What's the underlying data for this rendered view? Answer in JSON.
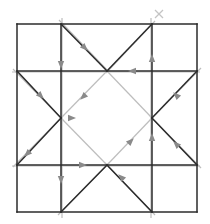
{
  "diagram": {
    "type": "crease-pattern-flow",
    "colors": {
      "background": "#ffffff",
      "dark_line": "#2b2b2b",
      "light_line": "#bdbdbd",
      "arrow": "#8a8a8a",
      "marker": "#c4c4c4"
    },
    "grid": {
      "outer": {
        "x1": 17,
        "y1": 24,
        "x2": 197,
        "y2": 212
      },
      "verticals": [
        61,
        152
      ],
      "horizontals": [
        71,
        165
      ]
    },
    "dark_lines": [
      {
        "x1": 17,
        "y1": 24,
        "x2": 197,
        "y2": 24
      },
      {
        "x1": 17,
        "y1": 212,
        "x2": 197,
        "y2": 212
      },
      {
        "x1": 17,
        "y1": 24,
        "x2": 17,
        "y2": 212
      },
      {
        "x1": 197,
        "y1": 24,
        "x2": 197,
        "y2": 212
      },
      {
        "x1": 61,
        "y1": 24,
        "x2": 61,
        "y2": 212
      },
      {
        "x1": 152,
        "y1": 24,
        "x2": 152,
        "y2": 212
      },
      {
        "x1": 17,
        "y1": 71,
        "x2": 197,
        "y2": 71
      },
      {
        "x1": 17,
        "y1": 165,
        "x2": 197,
        "y2": 165
      },
      {
        "x1": 61,
        "y1": 24,
        "x2": 107,
        "y2": 71
      },
      {
        "x1": 152,
        "y1": 24,
        "x2": 107,
        "y2": 71
      },
      {
        "x1": 197,
        "y1": 71,
        "x2": 152,
        "y2": 118
      },
      {
        "x1": 197,
        "y1": 165,
        "x2": 152,
        "y2": 118
      },
      {
        "x1": 152,
        "y1": 212,
        "x2": 107,
        "y2": 165
      },
      {
        "x1": 61,
        "y1": 212,
        "x2": 107,
        "y2": 165
      },
      {
        "x1": 17,
        "y1": 165,
        "x2": 61,
        "y2": 118
      },
      {
        "x1": 17,
        "y1": 71,
        "x2": 61,
        "y2": 118
      }
    ],
    "light_lines": [
      {
        "x1": 59,
        "y1": 20,
        "x2": 109,
        "y2": 72
      },
      {
        "x1": 155,
        "y1": 21,
        "x2": 106,
        "y2": 73
      },
      {
        "x1": 201,
        "y1": 68,
        "x2": 150,
        "y2": 120
      },
      {
        "x1": 201,
        "y1": 168,
        "x2": 150,
        "y2": 116
      },
      {
        "x1": 155,
        "y1": 215,
        "x2": 105,
        "y2": 163
      },
      {
        "x1": 58,
        "y1": 215,
        "x2": 109,
        "y2": 163
      },
      {
        "x1": 13,
        "y1": 167,
        "x2": 63,
        "y2": 116
      },
      {
        "x1": 13,
        "y1": 69,
        "x2": 63,
        "y2": 120
      },
      {
        "x1": 107,
        "y1": 71,
        "x2": 152,
        "y2": 118
      },
      {
        "x1": 152,
        "y1": 118,
        "x2": 107,
        "y2": 165
      },
      {
        "x1": 107,
        "y1": 165,
        "x2": 61,
        "y2": 118
      },
      {
        "x1": 61,
        "y1": 118,
        "x2": 107,
        "y2": 71
      },
      {
        "x1": 12,
        "y1": 72,
        "x2": 200,
        "y2": 72
      },
      {
        "x1": 12,
        "y1": 166,
        "x2": 200,
        "y2": 166
      },
      {
        "x1": 62,
        "y1": 18,
        "x2": 62,
        "y2": 218
      },
      {
        "x1": 151,
        "y1": 18,
        "x2": 151,
        "y2": 218
      }
    ],
    "arrows": [
      {
        "x": 85,
        "y": 48,
        "angle": 45
      },
      {
        "x": 61,
        "y": 65,
        "angle": 90
      },
      {
        "x": 152,
        "y": 58,
        "angle": -90
      },
      {
        "x": 132,
        "y": 71,
        "angle": 180
      },
      {
        "x": 41,
        "y": 96,
        "angle": 45
      },
      {
        "x": 83,
        "y": 97,
        "angle": 135
      },
      {
        "x": 176,
        "y": 95,
        "angle": -135
      },
      {
        "x": 27,
        "y": 154,
        "angle": 135
      },
      {
        "x": 152,
        "y": 137,
        "angle": -90
      },
      {
        "x": 176,
        "y": 144,
        "angle": -135
      },
      {
        "x": 131,
        "y": 141,
        "angle": -45
      },
      {
        "x": 83,
        "y": 165,
        "angle": 0
      },
      {
        "x": 61,
        "y": 180,
        "angle": 90
      },
      {
        "x": 121,
        "y": 177,
        "angle": -135
      },
      {
        "x": 72,
        "y": 118,
        "angle": 0
      }
    ],
    "markers": [
      {
        "type": "x",
        "x": 159,
        "y": 14
      }
    ]
  }
}
